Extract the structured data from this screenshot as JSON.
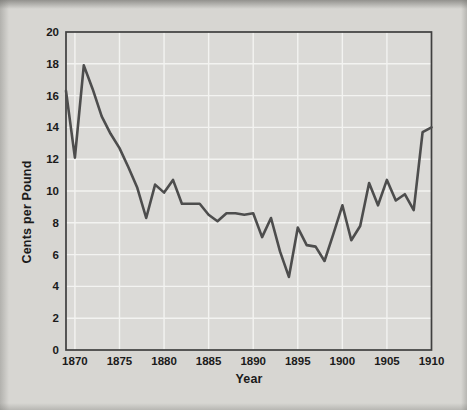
{
  "chart_data": {
    "type": "line",
    "x": [
      1869,
      1870,
      1871,
      1872,
      1873,
      1874,
      1875,
      1876,
      1877,
      1878,
      1879,
      1880,
      1881,
      1882,
      1883,
      1884,
      1885,
      1886,
      1887,
      1888,
      1889,
      1890,
      1891,
      1892,
      1893,
      1894,
      1895,
      1896,
      1897,
      1898,
      1899,
      1900,
      1901,
      1902,
      1903,
      1904,
      1905,
      1906,
      1907,
      1908,
      1909,
      1910
    ],
    "values": [
      16.3,
      12.1,
      17.9,
      16.4,
      14.7,
      13.6,
      12.7,
      11.5,
      10.2,
      8.3,
      10.4,
      9.9,
      10.7,
      9.2,
      9.2,
      9.2,
      8.5,
      8.1,
      8.6,
      8.6,
      8.5,
      8.6,
      7.1,
      8.3,
      6.2,
      4.6,
      7.7,
      6.6,
      6.5,
      5.6,
      7.3,
      9.1,
      6.9,
      7.8,
      10.5,
      9.1,
      10.7,
      9.4,
      9.8,
      8.8,
      13.7,
      14.0
    ],
    "xlabel": "Year",
    "ylabel": "Cents per Pound",
    "xlim": [
      1869,
      1910
    ],
    "ylim": [
      0,
      20
    ],
    "x_ticks": [
      1870,
      1875,
      1880,
      1885,
      1890,
      1895,
      1900,
      1905,
      1910
    ],
    "y_ticks": [
      0,
      2,
      4,
      6,
      8,
      10,
      12,
      14,
      16,
      18,
      20
    ],
    "grid": true,
    "legend": "none",
    "colors": {
      "background": "#d7d6d2",
      "plot_background": "#dbdad7",
      "gridline": "#f3f3f1",
      "frame": "#3f3f3f",
      "line": "#4d4d4d",
      "text": "#1b1b1b"
    }
  }
}
